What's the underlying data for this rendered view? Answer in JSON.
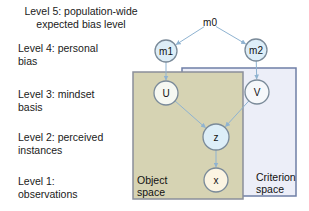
{
  "levels": [
    {
      "id": "level5",
      "line1": "Level 5: population-wide",
      "line2": "expected bias level"
    },
    {
      "id": "level4",
      "line1": "Level 4: personal",
      "line2": "bias"
    },
    {
      "id": "level3",
      "line1": "Level 3: mindset",
      "line2": "basis"
    },
    {
      "id": "level2",
      "line1": "Level 2: perceived",
      "line2": "instances"
    },
    {
      "id": "level1",
      "line1": "Level 1:",
      "line2": "observations"
    }
  ],
  "spaces": {
    "object": {
      "line1": "Object",
      "line2": "space",
      "fill": "#d6d3b3",
      "stroke": "#8a8f9a"
    },
    "criterion": {
      "line1": "Criterion",
      "line2": "space",
      "fill": "#eceef8",
      "stroke": "#6f7fa6"
    }
  },
  "nodes": {
    "m0": {
      "label": "m0"
    },
    "m1": {
      "label": "m1",
      "fill": "#ddeef8"
    },
    "m2": {
      "label": "m2",
      "fill": "#ddeef8"
    },
    "U": {
      "label": "U",
      "fill": "#f6f8f2"
    },
    "V": {
      "label": "V",
      "fill": "#f6f8fb"
    },
    "z": {
      "label": "z",
      "fill": "#ddeef8"
    },
    "x": {
      "label": "x",
      "fill": "#fbf4e2"
    }
  },
  "edges": [
    {
      "from": "m0",
      "to": "m1"
    },
    {
      "from": "m0",
      "to": "m2"
    },
    {
      "from": "m1",
      "to": "U"
    },
    {
      "from": "m2",
      "to": "V"
    },
    {
      "from": "U",
      "to": "z"
    },
    {
      "from": "V",
      "to": "z"
    },
    {
      "from": "z",
      "to": "x"
    }
  ],
  "colors": {
    "edge": "#8fb3d1",
    "node_stroke": "#7a8a99"
  }
}
